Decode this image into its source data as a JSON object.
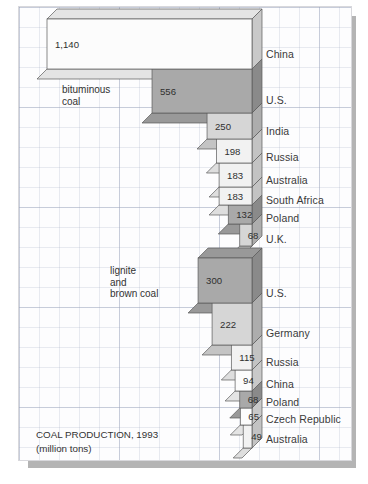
{
  "caption": {
    "title": "COAL PRODUCTION, 1993",
    "units": "(million tons)"
  },
  "series_notes": {
    "bituminous": "bituminous\ncoal",
    "lignite": "lignite\nand\nbrown coal"
  },
  "colors": {
    "light": "#f2f2f2",
    "light_alt": "#eaeaea",
    "mid": "#d6d6d6",
    "dark": "#a9a9a9",
    "white": "#fcfcfc",
    "shadow": "#b4b4b4",
    "outline": "#5a5a5a",
    "panel_bg": "#fdfdfe",
    "text": "#333333"
  },
  "chart_data": {
    "type": "bar",
    "title": "COAL PRODUCTION, 1993",
    "subtitle": "(million tons)",
    "xlabel": "",
    "ylabel": "",
    "orientation": "horizontal",
    "grid": true,
    "legend": "inline-annotations",
    "max_value": 1140,
    "series": [
      {
        "name": "bituminous coal",
        "categories": [
          "China",
          "U.S.",
          "India",
          "Russia",
          "Australia",
          "South Africa",
          "Poland",
          "U.K."
        ],
        "values": [
          1140,
          556,
          250,
          198,
          183,
          183,
          132,
          68
        ],
        "value_labels": [
          "1,140",
          "556",
          "250",
          "198",
          "183",
          "183",
          "132",
          "68"
        ],
        "fills": [
          "white",
          "dark",
          "mid",
          "light",
          "light",
          "light",
          "dark",
          "mid"
        ]
      },
      {
        "name": "lignite and brown coal",
        "categories": [
          "U.S.",
          "Germany",
          "Russia",
          "China",
          "Poland",
          "Czech Republic",
          "Australia"
        ],
        "values": [
          300,
          222,
          115,
          94,
          68,
          65,
          49
        ],
        "value_labels": [
          "300",
          "222",
          "115",
          "94",
          "68",
          "65",
          "49"
        ],
        "fills": [
          "dark",
          "mid",
          "light",
          "white",
          "dark",
          "white",
          "light"
        ]
      }
    ]
  }
}
